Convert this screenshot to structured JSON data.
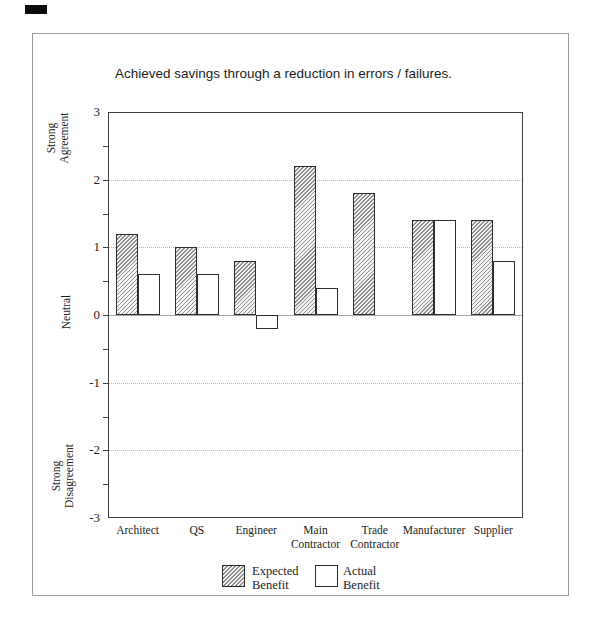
{
  "chart_data": {
    "type": "bar",
    "title": "Achieved savings through a reduction in errors / failures.",
    "categories": [
      "Architect",
      "QS",
      "Engineer",
      "Main\nContractor",
      "Trade\nContractor",
      "Manufacturer",
      "Supplier"
    ],
    "series": [
      {
        "name": "Expected Benefit",
        "style": "hatched",
        "values": [
          1.2,
          1.0,
          0.8,
          2.2,
          1.8,
          1.4,
          1.4
        ]
      },
      {
        "name": "Actual Benefit",
        "style": "white",
        "values": [
          0.6,
          0.6,
          -0.2,
          0.4,
          0,
          1.4,
          0.8
        ]
      }
    ],
    "ylim": [
      -3,
      3
    ],
    "yticks": [
      3,
      2,
      1,
      0,
      -1,
      -2,
      -3
    ],
    "minor_tick_step": 0.5,
    "gridlines_at": [
      2,
      1,
      -1,
      -2
    ],
    "grid_style": "dotted",
    "zero_line_at": 0,
    "y_region_labels": [
      {
        "text": "Strong\nAgreement",
        "at_value": 2.62
      },
      {
        "text": "Neutral",
        "at_value": 0.05
      },
      {
        "text": "Strong\nDisagreement",
        "at_value": -2.38
      }
    ],
    "legend": [
      {
        "label": "Expected\nBenefit",
        "style": "hatched"
      },
      {
        "label": "Actual\nBenefit",
        "style": "white"
      }
    ],
    "legend_position": "bottom"
  },
  "colors": {
    "bar_border": "#2d2d2d",
    "hatch_line": "#8e8e8e",
    "hatch_bg": "#f2f2f2",
    "plot_frame": "#3f3f3f",
    "grid": "#b6b6b6",
    "zero_line": "#a6a6a6",
    "outer_border": "#9b9b9b",
    "text": "#1c1c1c",
    "background": "#ffffff"
  }
}
